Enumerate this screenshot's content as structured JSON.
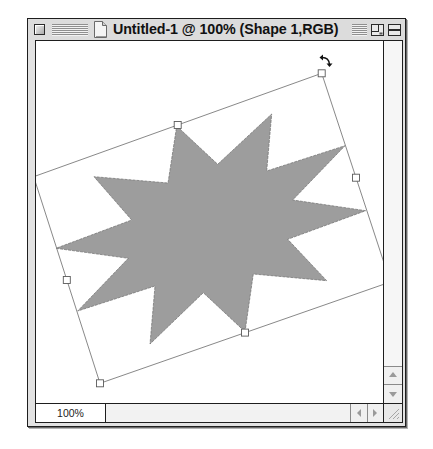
{
  "window": {
    "title": "Untitled-1 @ 100% (Shape 1,RGB)",
    "title_bar": {
      "close_box_icon": "close-box-icon",
      "proxy_icon": "document-icon",
      "zoom_box_icon": "zoom-box-icon",
      "collapse_box_icon": "collapse-box-icon"
    }
  },
  "status_bar": {
    "zoom_level": "100%"
  },
  "scrollbars": {
    "vertical": {
      "up_icon": "scroll-up-arrow-icon",
      "down_icon": "scroll-down-arrow-icon"
    },
    "horizontal": {
      "left_icon": "scroll-left-arrow-icon",
      "right_icon": "scroll-right-arrow-icon"
    },
    "grow_box_icon": "resize-grip-icon"
  },
  "canvas": {
    "background": "#ffffff",
    "star": {
      "layer_name": "Shape 1",
      "fill": "#9d9d9d",
      "points": "176.7,126 217.7,164.3 271.7,114 266.7,171 345,145.7 292.7,200 365.7,210.7 287.7,239.3 326.7,280.7 253.3,274 245,331.7 203.3,292.7 150,344 155,286 77.7,311 128.3,258.3 56,248.3 131.7,220 94,176.7 168,183"
    },
    "bounding_box": {
      "points": "33.7,176.7 321.7,73.3 390.3,282 100,383.3",
      "stroke": "#7a7a7a"
    },
    "handles": [
      {
        "position": "top-right",
        "transform": "translate(321.7,73.3)"
      },
      {
        "position": "top-middle",
        "transform": "translate(177.7,125)"
      },
      {
        "position": "right-middle",
        "transform": "translate(356,177.7)"
      },
      {
        "position": "left-middle",
        "transform": "translate(66.8,280)"
      },
      {
        "position": "bottom-middle",
        "transform": "translate(245,332.6)"
      },
      {
        "position": "bottom-left",
        "transform": "translate(100,383.3)"
      }
    ],
    "cursor": {
      "type": "rotate",
      "transform": "translate(326,61)"
    }
  },
  "colors": {
    "title_bar": "#dcdcdc",
    "frame": "#e2e2e2",
    "border": "#1e1e1e",
    "shape_fill": "#9d9d9d"
  }
}
